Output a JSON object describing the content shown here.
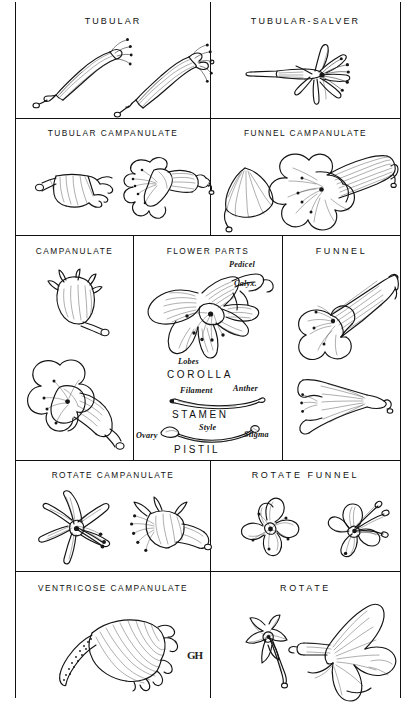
{
  "plate": {
    "kind": "botanical-illustration-plate",
    "subject": "Corolla shapes and flower parts",
    "signature": "GH"
  },
  "panels": [
    {
      "id": "tubular",
      "title": "TUBULAR",
      "figure_count": 2,
      "figures": [
        "tubular-corolla-side-view",
        "tubular-corolla-with-exserted-stamens"
      ]
    },
    {
      "id": "tubular-salver",
      "title": "TUBULAR-SALVER",
      "figure_count": 1,
      "figures": [
        "salverform-corolla-with-long-tube-and-flat-limb"
      ]
    },
    {
      "id": "tubular-campanulate",
      "title": "TUBULAR CAMPANULATE",
      "figure_count": 2,
      "figures": [
        "tubular-campanulate-side-view",
        "tubular-campanulate-oblique-face-view"
      ]
    },
    {
      "id": "funnel-campanulate",
      "title": "FUNNEL CAMPANULATE",
      "figure_count": 2,
      "figures": [
        "funnel-campanulate-small-side-view",
        "funnel-campanulate-large-oblique-view"
      ]
    },
    {
      "id": "campanulate",
      "title": "CAMPANULATE",
      "figure_count": 2,
      "figures": [
        "campanulate-bell-side-view",
        "campanulate-open-oblique-view"
      ]
    },
    {
      "id": "flower-parts",
      "title": "FLOWER PARTS",
      "figure_count": 3,
      "figures": [
        "dissected-flower-corolla",
        "stamen-diagram",
        "pistil-diagram"
      ],
      "labels": {
        "pedicel": "Pedicel",
        "calyx": "Calyx.",
        "lobes": "Lobes",
        "corolla": "COROLLA",
        "filament": "Filament",
        "anther": "Anther",
        "stamen": "STAMEN",
        "ovary": "Ovary",
        "style": "Style",
        "stigma": "Stigma",
        "pistil": "PISTIL"
      }
    },
    {
      "id": "funnel",
      "title": "FUNNEL",
      "figure_count": 2,
      "figures": [
        "funnelform-corolla-oblique-view",
        "funnelform-corolla-side-view"
      ]
    },
    {
      "id": "rotate-campanulate",
      "title": "ROTATE CAMPANULATE",
      "figure_count": 2,
      "figures": [
        "rotate-campanulate-face-view",
        "rotate-campanulate-side-view"
      ]
    },
    {
      "id": "rotate-funnel",
      "title": "ROTATE FUNNEL",
      "figure_count": 2,
      "figures": [
        "rotate-funnel-face-view",
        "rotate-funnel-oblique-view"
      ]
    },
    {
      "id": "ventricose-campanulate",
      "title": "VENTRICOSE CAMPANULATE",
      "figure_count": 1,
      "figures": [
        "ventricose-campanulate-side-view"
      ]
    },
    {
      "id": "rotate",
      "title": "ROTATE",
      "figure_count": 2,
      "figures": [
        "rotate-corolla-small-side-view",
        "rotate-corolla-large-side-view"
      ]
    }
  ]
}
